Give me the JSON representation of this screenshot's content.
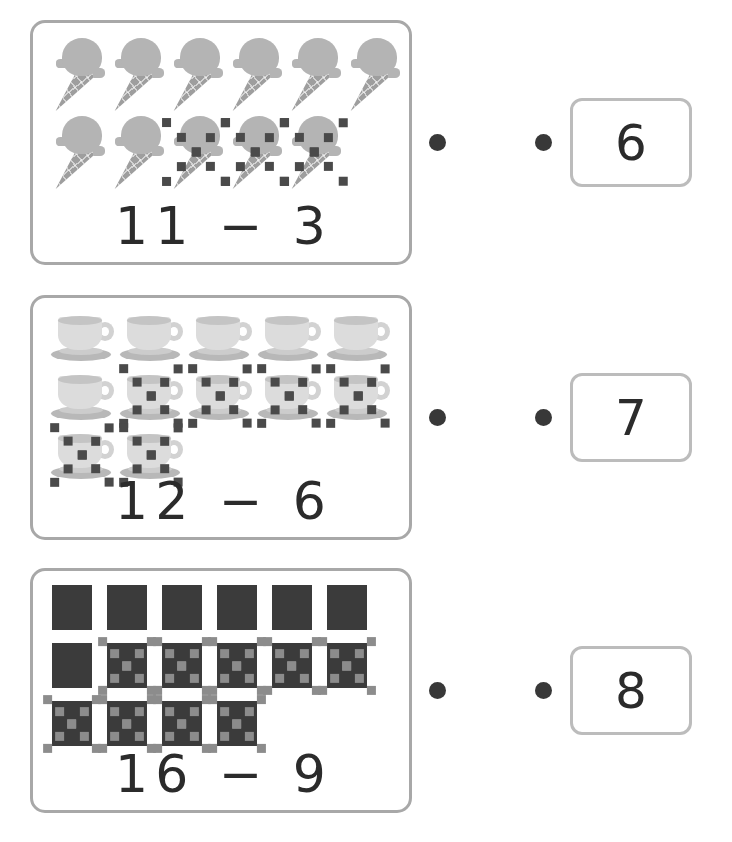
{
  "worksheet": {
    "type": "matching-subtraction-worksheet",
    "page_background": "#ffffff",
    "card_border_color": "#a8a8a8",
    "answer_box_border_color": "#bcbcbc",
    "dot_color": "#383838",
    "equation_color": "#2b2b2b"
  },
  "problems": [
    {
      "id": "problem-1",
      "object": "ice-cream-cone-icon",
      "object_color": "#b4b4b4",
      "equation": "11 − 3",
      "minuend": 11,
      "subtrahend": 3,
      "total_objects": 11,
      "crossed_out": 3,
      "rows": [
        {
          "count": 6,
          "crossed": [
            false,
            false,
            false,
            false,
            false,
            false
          ]
        },
        {
          "count": 5,
          "crossed": [
            false,
            false,
            true,
            true,
            true
          ]
        }
      ]
    },
    {
      "id": "problem-2",
      "object": "teacup-icon",
      "object_color": "#dcdcdc",
      "equation": "12 − 6",
      "minuend": 12,
      "subtrahend": 6,
      "total_objects": 12,
      "crossed_out": 6,
      "rows": [
        {
          "count": 5,
          "crossed": [
            false,
            false,
            false,
            false,
            false
          ]
        },
        {
          "count": 5,
          "crossed": [
            false,
            true,
            true,
            true,
            true
          ]
        },
        {
          "count": 2,
          "crossed": [
            true,
            true
          ]
        }
      ]
    },
    {
      "id": "problem-3",
      "object": "dark-square-icon",
      "object_color": "#3b3b3b",
      "equation": "16 − 9",
      "minuend": 16,
      "subtrahend": 9,
      "total_objects": 16,
      "crossed_out": 9,
      "rows": [
        {
          "count": 6,
          "crossed": [
            false,
            false,
            false,
            false,
            false,
            false
          ]
        },
        {
          "count": 6,
          "crossed": [
            false,
            true,
            true,
            true,
            true,
            true
          ]
        },
        {
          "count": 4,
          "crossed": [
            true,
            true,
            true,
            true
          ]
        }
      ]
    }
  ],
  "answers": [
    {
      "id": "answer-1",
      "value": "6"
    },
    {
      "id": "answer-2",
      "value": "7"
    },
    {
      "id": "answer-3",
      "value": "8"
    }
  ]
}
